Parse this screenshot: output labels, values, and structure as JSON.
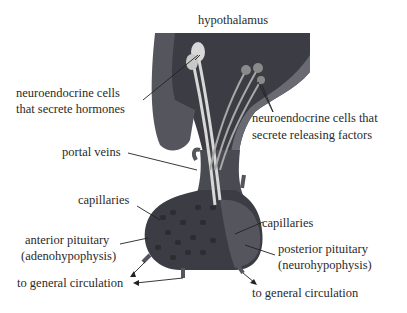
{
  "diagram": {
    "type": "anatomy",
    "labels": {
      "hypothalamus": "hypothalamus",
      "neuro_hormones_1": "neuroendocrine cells",
      "neuro_hormones_2": "that secrete hormones",
      "neuro_releasing_1": "neuroendocrine cells that",
      "neuro_releasing_2": "secrete releasing factors",
      "portal_veins": "portal veins",
      "capillaries_left": "capillaries",
      "capillaries_right": "capillaries",
      "anterior_1": "anterior pituitary",
      "anterior_2": "(adenohypophysis)",
      "posterior_1": "posterior pituitary",
      "posterior_2": "(neurohypophysis)",
      "circulation_left": "to general circulation",
      "circulation_right": "to general circulation"
    },
    "colors": {
      "tissue_dark": "#3c3c44",
      "tissue_mid": "#55555d",
      "tissue_light": "#6a6a72",
      "axon": "#d8d8d8",
      "text": "#2a2a2a",
      "background": "#ffffff"
    }
  }
}
